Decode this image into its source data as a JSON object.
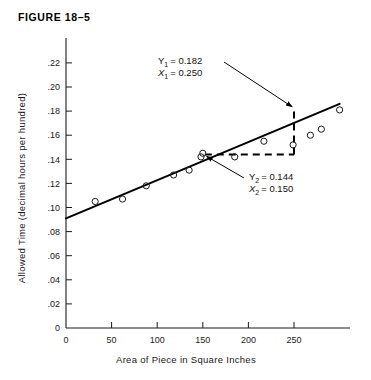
{
  "figure": {
    "title": "FIGURE 18–5"
  },
  "chart_data": {
    "type": "scatter",
    "title": "FIGURE 18–5",
    "xlabel": "Area of Piece in Square Inches",
    "ylabel": "Allowed Time (decimal hours per hundred)",
    "xlim": [
      0,
      310
    ],
    "ylim": [
      0,
      0.23
    ],
    "grid": false,
    "legend": null,
    "xticks": [
      0,
      50,
      100,
      150,
      200,
      250
    ],
    "xticklabels": [
      "0",
      "50",
      "100",
      "150",
      "200",
      "250"
    ],
    "yticks": [
      0,
      0.02,
      0.04,
      0.06,
      0.08,
      0.1,
      0.12,
      0.14,
      0.16,
      0.18,
      0.2,
      0.22
    ],
    "yticklabels": [
      "0",
      ".02",
      ".04",
      ".06",
      ".08",
      ".10",
      ".12",
      ".14",
      ".16",
      ".18",
      ".20",
      ".22"
    ],
    "points": [
      {
        "x": 32,
        "y": 0.105
      },
      {
        "x": 62,
        "y": 0.107
      },
      {
        "x": 88,
        "y": 0.118
      },
      {
        "x": 118,
        "y": 0.127
      },
      {
        "x": 135,
        "y": 0.131
      },
      {
        "x": 148,
        "y": 0.142
      },
      {
        "x": 150,
        "y": 0.145
      },
      {
        "x": 185,
        "y": 0.142
      },
      {
        "x": 217,
        "y": 0.155
      },
      {
        "x": 249,
        "y": 0.152
      },
      {
        "x": 268,
        "y": 0.16
      },
      {
        "x": 280,
        "y": 0.165
      },
      {
        "x": 300,
        "y": 0.181
      }
    ],
    "trend_line": {
      "name": "line of best fit",
      "x_start": 0,
      "y_start": 0.091,
      "x_end": 300,
      "y_end": 0.186
    },
    "construction_triangle": {
      "x1": 250,
      "y1": 0.182,
      "x2": 150,
      "y2": 0.144,
      "style": "dashed"
    },
    "annotations": [
      {
        "id": "point-1",
        "lines": [
          {
            "var": "Y",
            "sub": "1",
            "eq": "= 0.182"
          },
          {
            "var": "X",
            "sub": "1",
            "eq": "= 0.250"
          }
        ],
        "points_to_x": 250,
        "points_to_y": 0.182
      },
      {
        "id": "point-2",
        "lines": [
          {
            "var": "Y",
            "sub": "2",
            "eq": "= 0.144"
          },
          {
            "var": "X",
            "sub": "2",
            "eq": "= 0.150"
          }
        ],
        "points_to_x": 150,
        "points_to_y": 0.144
      }
    ]
  }
}
